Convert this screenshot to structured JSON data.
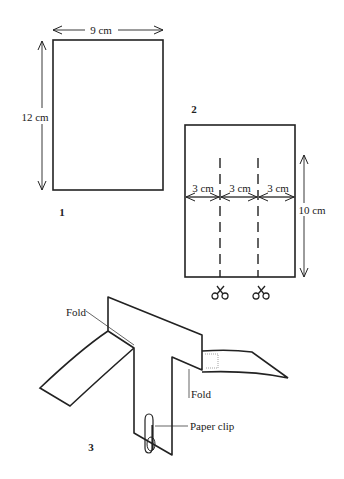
{
  "figure1": {
    "number": "1",
    "width_label": "9 cm",
    "height_label": "12 cm"
  },
  "figure2": {
    "number": "2",
    "segment_labels": [
      "3 cm",
      "3 cm",
      "3 cm"
    ],
    "height_label": "10 cm",
    "cut_icons": [
      "scissors-icon",
      "scissors-icon"
    ]
  },
  "figure3": {
    "number": "3",
    "fold_label_left": "Fold",
    "fold_label_right": "Fold",
    "clip_label": "Paper clip"
  }
}
